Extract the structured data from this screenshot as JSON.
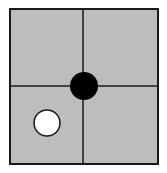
{
  "diagram": {
    "type": "go-board-fragment",
    "board": {
      "background": "#bdbdbd",
      "line_color": "#1a1a1a",
      "x": 10,
      "y": 9,
      "width": 148,
      "height": 155,
      "grid_lines": {
        "vertical_x": 83,
        "horizontal_y": 86
      }
    },
    "stones": [
      {
        "color": "black",
        "fill": "#000000",
        "cx": 84,
        "cy": 86,
        "r": 14
      },
      {
        "color": "white",
        "fill": "#ffffff",
        "cx": 47,
        "cy": 123,
        "r": 14
      }
    ]
  }
}
